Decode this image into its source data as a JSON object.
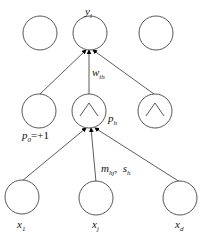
{
  "diagram": {
    "type": "rbf-network",
    "output_layer": {
      "nodes": [
        {
          "id": "out-1",
          "label": ""
        },
        {
          "id": "out-i",
          "label": "y",
          "sub": "i"
        },
        {
          "id": "out-3",
          "label": ""
        }
      ]
    },
    "hidden_layer": {
      "nodes": [
        {
          "id": "bias",
          "label": "p",
          "sub": "0",
          "suffix": "=+1",
          "gaussian": false
        },
        {
          "id": "hidden-h",
          "label": "p",
          "sub": "h",
          "gaussian": true
        },
        {
          "id": "hidden-3",
          "label": "",
          "gaussian": true
        }
      ]
    },
    "input_layer": {
      "nodes": [
        {
          "id": "x1",
          "label": "x",
          "sub": "1"
        },
        {
          "id": "xj",
          "label": "x",
          "sub": "j"
        },
        {
          "id": "xd",
          "label": "x",
          "sub": "d"
        }
      ]
    },
    "edge_labels": {
      "hidden_to_output": {
        "label": "w",
        "sub": "ih"
      },
      "input_to_hidden": {
        "label1": "m",
        "sub1": "hj",
        "sep": ",",
        "label2": "s",
        "sub2": "h"
      }
    }
  }
}
